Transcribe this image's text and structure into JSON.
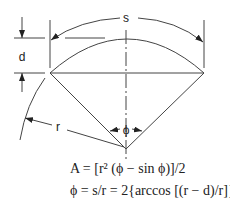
{
  "diagram": {
    "type": "circular-segment",
    "labels": {
      "arc_length": "s",
      "height": "d",
      "radius": "r",
      "angle": "ϕ"
    },
    "formulas": [
      "A = [r² (ϕ − sin ϕ)]/2",
      "ϕ = s/r = 2{arccos [(r − d)/r]}"
    ],
    "colors": {
      "stroke": "#333333",
      "background": "#ffffff"
    }
  }
}
